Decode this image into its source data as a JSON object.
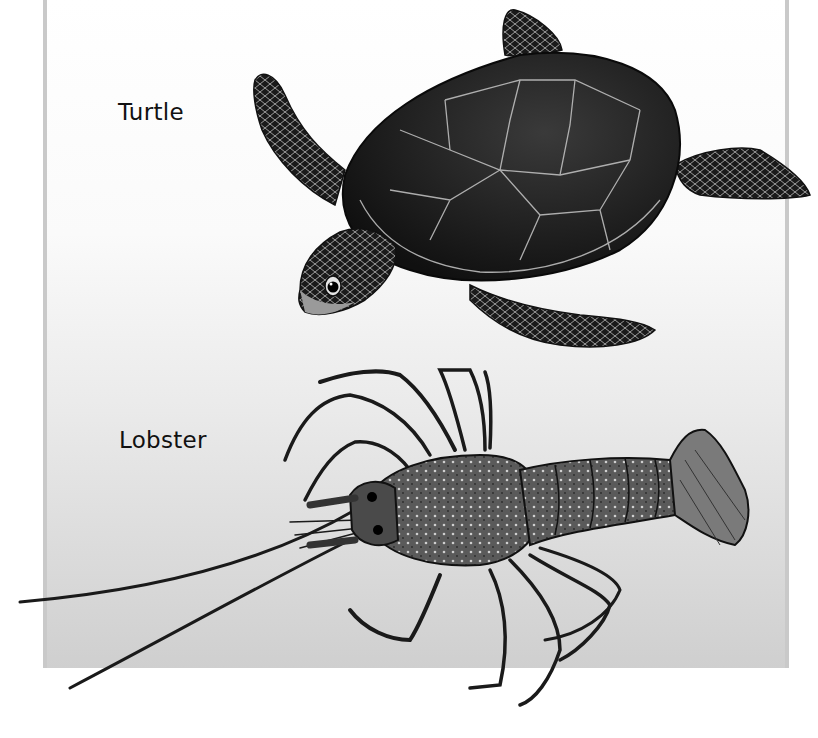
{
  "illustration": {
    "background": {
      "top_color": "#ffffff",
      "bottom_color": "#cfcfcf",
      "border_color": "#c9c9c9"
    },
    "labels": [
      {
        "text": "Turtle"
      },
      {
        "text": "Lobster"
      }
    ],
    "subjects": [
      {
        "name": "sea turtle",
        "style": "black-and-white illustration"
      },
      {
        "name": "spiny lobster",
        "style": "black-and-white illustration"
      }
    ]
  }
}
